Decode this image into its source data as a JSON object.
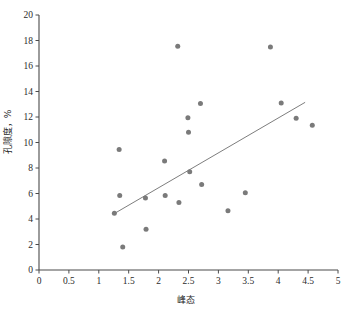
{
  "chart_data": {
    "type": "scatter",
    "title": "",
    "xlabel": "峰态",
    "ylabel": "孔隙度，%",
    "xlim": [
      0,
      5
    ],
    "ylim": [
      0,
      20
    ],
    "xticks": [
      "0",
      "0.5",
      "1",
      "1.5",
      "2",
      "2.5",
      "3",
      "3.5",
      "4",
      "4.5",
      "5"
    ],
    "xtick_values": [
      0,
      0.5,
      1,
      1.5,
      2,
      2.5,
      3,
      3.5,
      4,
      4.5,
      5
    ],
    "yticks": [
      "0",
      "2",
      "4",
      "6",
      "8",
      "10",
      "12",
      "14",
      "16",
      "18",
      "20"
    ],
    "ytick_values": [
      0,
      2,
      4,
      6,
      8,
      10,
      12,
      14,
      16,
      18,
      20
    ],
    "grid": false,
    "legend": null,
    "point_color": "#7a7a7a",
    "line_color": "#6e6e6e",
    "axis_color": "#4a4a4a",
    "points": [
      {
        "x": 1.26,
        "y": 4.45
      },
      {
        "x": 1.34,
        "y": 9.45
      },
      {
        "x": 1.35,
        "y": 5.85
      },
      {
        "x": 1.4,
        "y": 1.8
      },
      {
        "x": 1.78,
        "y": 5.65
      },
      {
        "x": 1.79,
        "y": 3.2
      },
      {
        "x": 2.1,
        "y": 8.55
      },
      {
        "x": 2.11,
        "y": 5.85
      },
      {
        "x": 2.32,
        "y": 17.55
      },
      {
        "x": 2.34,
        "y": 5.3
      },
      {
        "x": 2.49,
        "y": 11.95
      },
      {
        "x": 2.5,
        "y": 10.8
      },
      {
        "x": 2.52,
        "y": 7.7
      },
      {
        "x": 2.7,
        "y": 13.05
      },
      {
        "x": 2.72,
        "y": 6.7
      },
      {
        "x": 3.16,
        "y": 4.65
      },
      {
        "x": 3.45,
        "y": 6.05
      },
      {
        "x": 3.87,
        "y": 17.5
      },
      {
        "x": 4.05,
        "y": 13.1
      },
      {
        "x": 4.3,
        "y": 11.9
      },
      {
        "x": 4.57,
        "y": 11.35
      }
    ],
    "trend": {
      "x0": 1.25,
      "y0": 4.4,
      "x1": 4.45,
      "y1": 13.15
    }
  }
}
